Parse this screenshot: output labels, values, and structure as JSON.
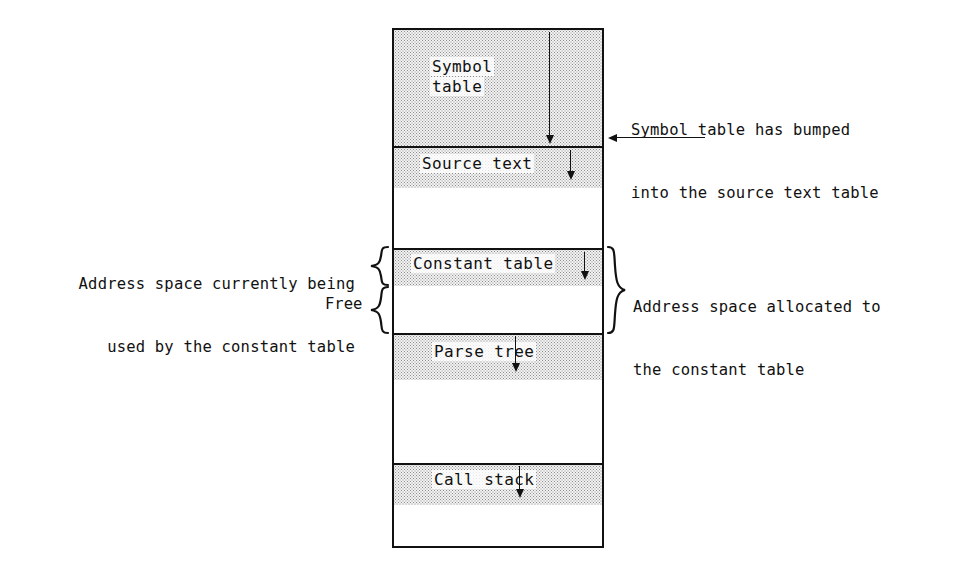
{
  "diagram": {
    "accent_color": "#111111",
    "shade_color": "#f2f2f2",
    "memory_box": {
      "name": "address-space",
      "regions": [
        {
          "id": "symbol-table",
          "label": "Symbol\ntable",
          "label_line1": "Symbol",
          "label_line2": "table",
          "grows": "down"
        },
        {
          "id": "source-text",
          "label": "Source text",
          "grows": "down"
        },
        {
          "id": "constant-table",
          "label": "Constant table",
          "grows": "down"
        },
        {
          "id": "free-space",
          "label": "Free",
          "grows": "none"
        },
        {
          "id": "parse-tree",
          "label": "Parse tree",
          "grows": "down"
        },
        {
          "id": "call-stack",
          "label": "Call stack",
          "grows": "down"
        }
      ]
    },
    "annotations": [
      {
        "id": "symbol-table-collision",
        "line1": "Symbol table has bumped",
        "line2": "into the source text table",
        "pointer": "arrow-left"
      },
      {
        "id": "constant-table-used",
        "line1": "Address space currently being",
        "line2": "used by the constant table",
        "pointer": "brace-right"
      },
      {
        "id": "constant-table-allocated",
        "line1": "Address space allocated to",
        "line2": "the constant table",
        "pointer": "brace-left"
      },
      {
        "id": "free-space-label",
        "line1": "Free",
        "pointer": "brace-right"
      }
    ]
  }
}
